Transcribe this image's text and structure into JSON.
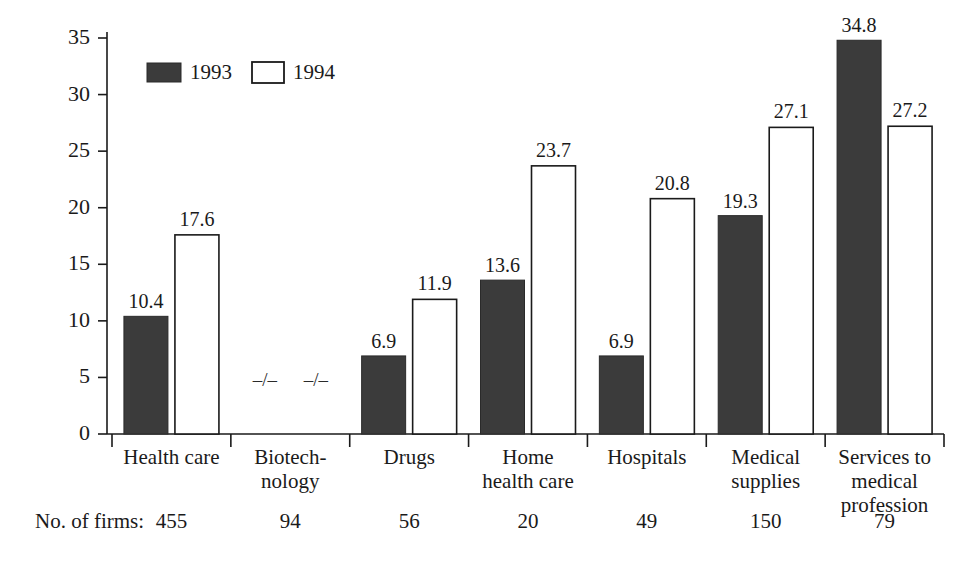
{
  "chart_data": {
    "type": "bar",
    "title": "",
    "subtitle": "",
    "xlabel": "",
    "ylabel": "",
    "ylim": [
      0,
      35
    ],
    "yticks": [
      0,
      5,
      10,
      15,
      20,
      25,
      30,
      35
    ],
    "grid": false,
    "legend_position": "top-left-inside",
    "categories": [
      "Health care",
      "Biotech-\nnology",
      "Drugs",
      "Home\nhealth care",
      "Hospitals",
      "Medical\nsupplies",
      "Services to\nmedical\nprofession"
    ],
    "category_lines": [
      [
        "Health care"
      ],
      [
        "Biotech-",
        "nology"
      ],
      [
        "Drugs"
      ],
      [
        "Home",
        "health care"
      ],
      [
        "Hospitals"
      ],
      [
        "Medical",
        "supplies"
      ],
      [
        "Services to",
        "medical",
        "profession"
      ]
    ],
    "series": [
      {
        "name": "1993",
        "color": "#3b3b3b",
        "values": [
          10.4,
          null,
          6.9,
          13.6,
          6.9,
          19.3,
          34.8
        ],
        "value_labels": [
          "10.4",
          "–/–",
          "6.9",
          "13.6",
          "6.9",
          "19.3",
          "34.8"
        ]
      },
      {
        "name": "1994",
        "color": "#ffffff",
        "values": [
          17.6,
          null,
          11.9,
          23.7,
          20.8,
          27.1,
          27.2
        ],
        "value_labels": [
          "17.6",
          "–/–",
          "11.9",
          "23.7",
          "20.8",
          "27.1",
          "27.2"
        ]
      }
    ],
    "missing_marker": "–/–",
    "annotations": {
      "firms_caption": "No. of firms:",
      "firms_values": [
        "455",
        "94",
        "56",
        "20",
        "49",
        "150",
        "79"
      ]
    }
  },
  "legend": {
    "entries": [
      {
        "label": "1993",
        "swatch": "filled-dark-square"
      },
      {
        "label": "1994",
        "swatch": "open-white-square"
      }
    ]
  },
  "colors": {
    "series_1993": "#3b3b3b",
    "series_1994": "#ffffff",
    "axis": "#1a1a1a",
    "text": "#1a1a1a",
    "background": "#ffffff"
  }
}
